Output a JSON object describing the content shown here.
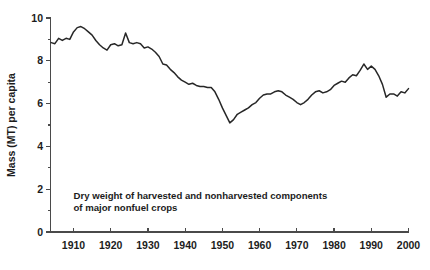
{
  "chart_data": {
    "type": "line",
    "title": "",
    "subtitle": "",
    "xlabel": "",
    "ylabel": "Mass (MT) per capita",
    "xlim": [
      1904,
      2000
    ],
    "ylim": [
      0,
      10
    ],
    "grid": false,
    "legend": null,
    "legend_position": "none",
    "annotations": [
      {
        "id": "caption",
        "line1": "Dry weight of harvested and nonharvested components",
        "line2": "of major nonfuel crops",
        "x": 1910,
        "y": 1.55
      }
    ],
    "x_ticks": [
      1910,
      1920,
      1930,
      1940,
      1950,
      1960,
      1970,
      1980,
      1990,
      2000
    ],
    "x_tick_labels": [
      "1910",
      "1920",
      "1930",
      "1940",
      "1950",
      "1960",
      "1970",
      "1980",
      "1990",
      "2000"
    ],
    "y_ticks": [
      0,
      2,
      4,
      6,
      8,
      10
    ],
    "y_tick_labels": [
      "0",
      "2",
      "4",
      "6",
      "8",
      "10"
    ],
    "y_minor_ticks": [
      1,
      3,
      5,
      7,
      9
    ],
    "series": [
      {
        "name": "Dry weight per capita",
        "color": "#272727",
        "x": [
          1904,
          1905,
          1906,
          1907,
          1908,
          1909,
          1910,
          1911,
          1912,
          1913,
          1914,
          1915,
          1916,
          1917,
          1918,
          1919,
          1920,
          1921,
          1922,
          1923,
          1924,
          1925,
          1926,
          1927,
          1928,
          1929,
          1930,
          1931,
          1932,
          1933,
          1934,
          1935,
          1936,
          1937,
          1938,
          1939,
          1940,
          1941,
          1942,
          1943,
          1944,
          1945,
          1946,
          1947,
          1948,
          1949,
          1950,
          1951,
          1952,
          1953,
          1954,
          1955,
          1956,
          1957,
          1958,
          1959,
          1960,
          1961,
          1962,
          1963,
          1964,
          1965,
          1966,
          1967,
          1968,
          1969,
          1970,
          1971,
          1972,
          1973,
          1974,
          1975,
          1976,
          1977,
          1978,
          1979,
          1980,
          1981,
          1982,
          1983,
          1984,
          1985,
          1986,
          1987,
          1988,
          1989,
          1990,
          1991,
          1992,
          1993,
          1994,
          1995,
          1996,
          1997,
          1998,
          1999,
          2000
        ],
        "y": [
          8.85,
          8.8,
          9.05,
          8.95,
          9.05,
          9.0,
          9.35,
          9.55,
          9.6,
          9.5,
          9.35,
          9.2,
          8.95,
          8.75,
          8.6,
          8.5,
          8.75,
          8.8,
          8.7,
          8.75,
          9.3,
          8.85,
          8.8,
          8.85,
          8.8,
          8.6,
          8.65,
          8.55,
          8.4,
          8.2,
          7.85,
          7.8,
          7.6,
          7.45,
          7.25,
          7.1,
          7.0,
          6.9,
          6.95,
          6.85,
          6.8,
          6.8,
          6.75,
          6.75,
          6.55,
          6.2,
          5.8,
          5.45,
          5.1,
          5.25,
          5.5,
          5.6,
          5.7,
          5.8,
          5.95,
          6.05,
          6.25,
          6.4,
          6.45,
          6.45,
          6.55,
          6.6,
          6.55,
          6.4,
          6.3,
          6.2,
          6.05,
          5.95,
          6.05,
          6.2,
          6.4,
          6.55,
          6.6,
          6.5,
          6.55,
          6.65,
          6.85,
          6.95,
          7.05,
          7.0,
          7.2,
          7.35,
          7.3,
          7.55,
          7.85,
          7.6,
          7.75,
          7.6,
          7.3,
          6.9,
          6.3,
          6.45,
          6.45,
          6.35,
          6.55,
          6.5,
          6.7
        ]
      }
    ]
  }
}
